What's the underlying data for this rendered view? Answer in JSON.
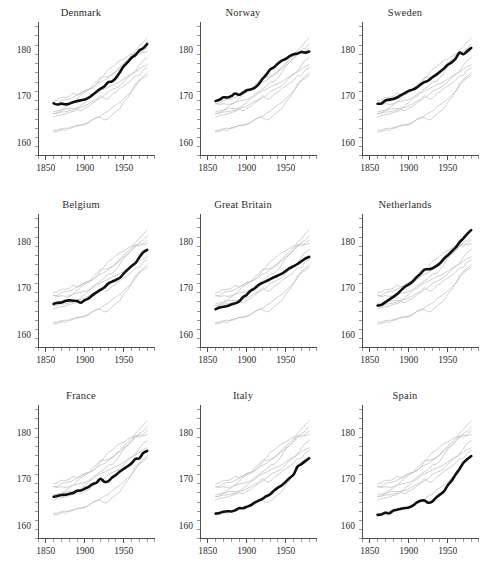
{
  "figure": {
    "type": "small-multiples",
    "panel_rows": 3,
    "panel_cols": 3,
    "background": "#ffffff",
    "focus_color": "#101010",
    "background_series_color": "#bdbdbd"
  },
  "axes": {
    "x_label": "",
    "y_label": "",
    "x_ticks": [
      1850,
      1900,
      1950
    ],
    "x_tick_labels": [
      "1850",
      "1900",
      "1950"
    ],
    "x_minor_step": 10,
    "x_range": [
      1840,
      1990
    ],
    "y_ticks": [
      160,
      170,
      180
    ],
    "y_tick_labels": [
      "160",
      "170",
      "180"
    ],
    "y_minor_step": 2,
    "y_range": [
      157,
      186
    ],
    "grid": false,
    "legend": "none"
  },
  "chart_data": {
    "type": "line",
    "title": "",
    "subtitle": "",
    "xlabel": "",
    "ylabel": "",
    "xlim": [
      1840,
      1990
    ],
    "ylim": [
      157,
      186
    ],
    "grid": false,
    "legend_position": "none",
    "panel_titles": [
      "Denmark",
      "Norway",
      "Sweden",
      "Belgium",
      "Great Britain",
      "Netherlands",
      "France",
      "Italy",
      "Spain"
    ],
    "x": [
      1860,
      1865,
      1870,
      1875,
      1880,
      1885,
      1890,
      1895,
      1900,
      1905,
      1910,
      1915,
      1920,
      1925,
      1930,
      1935,
      1940,
      1945,
      1950,
      1955,
      1960,
      1965,
      1970,
      1975,
      1980
    ],
    "series": [
      {
        "name": "Denmark",
        "values": [
          168.3,
          168.2,
          168.2,
          168.3,
          168.4,
          168.6,
          168.9,
          169.2,
          169.3,
          169.6,
          170.2,
          170.8,
          171.5,
          172.2,
          172.9,
          173.2,
          174.0,
          175.3,
          176.4,
          177.3,
          178.2,
          179.0,
          179.7,
          180.5,
          181.2
        ]
      },
      {
        "name": "Norway",
        "values": [
          168.8,
          169.1,
          169.6,
          169.7,
          169.8,
          170.4,
          170.3,
          170.7,
          171.1,
          171.3,
          171.9,
          172.6,
          173.6,
          174.6,
          175.6,
          176.2,
          176.9,
          177.5,
          178.0,
          178.5,
          178.9,
          179.3,
          179.4,
          179.5,
          179.6
        ]
      },
      {
        "name": "Sweden",
        "values": [
          168.2,
          168.3,
          168.9,
          169.2,
          169.5,
          169.8,
          170.2,
          170.6,
          171.0,
          171.4,
          171.9,
          172.4,
          172.9,
          173.4,
          173.9,
          174.5,
          175.2,
          175.9,
          176.6,
          177.4,
          178.2,
          179.3,
          179.0,
          179.7,
          180.3
        ]
      },
      {
        "name": "Belgium",
        "values": [
          166.6,
          166.7,
          166.9,
          167.1,
          167.3,
          167.2,
          167.0,
          166.9,
          167.4,
          167.8,
          168.3,
          168.9,
          169.6,
          170.2,
          170.9,
          171.4,
          171.9,
          172.3,
          173.2,
          173.9,
          174.6,
          175.5,
          176.5,
          177.6,
          178.3
        ]
      },
      {
        "name": "Great Britain",
        "values": [
          165.5,
          165.6,
          166.0,
          166.2,
          166.5,
          166.6,
          167.2,
          167.9,
          168.6,
          169.3,
          170.0,
          170.6,
          171.1,
          171.6,
          172.0,
          172.4,
          172.8,
          173.2,
          173.7,
          174.2,
          174.7,
          175.3,
          175.8,
          176.4,
          176.6
        ]
      },
      {
        "name": "Netherlands",
        "values": [
          166.2,
          166.5,
          167.0,
          167.5,
          168.1,
          168.7,
          169.4,
          170.1,
          170.8,
          171.5,
          172.3,
          173.2,
          173.9,
          174.0,
          174.1,
          174.7,
          175.5,
          176.3,
          177.1,
          178.0,
          178.9,
          179.8,
          180.7,
          181.8,
          182.6
        ]
      },
      {
        "name": "France",
        "values": [
          166.2,
          166.3,
          166.4,
          166.6,
          166.8,
          167.0,
          167.3,
          167.6,
          168.0,
          168.4,
          168.9,
          169.3,
          169.9,
          169.3,
          169.6,
          170.3,
          170.9,
          171.5,
          172.1,
          172.9,
          173.4,
          174.3,
          174.6,
          175.6,
          176.0
        ]
      },
      {
        "name": "Italy",
        "values": [
          162.5,
          162.7,
          162.8,
          162.9,
          163.1,
          163.3,
          163.6,
          163.6,
          163.9,
          164.3,
          164.7,
          165.2,
          165.7,
          166.3,
          166.8,
          167.4,
          168.0,
          168.6,
          169.4,
          170.2,
          171.0,
          172.6,
          173.2,
          174.0,
          174.4
        ]
      },
      {
        "name": "Spain",
        "values": [
          162.1,
          162.3,
          162.8,
          162.7,
          163.1,
          163.3,
          163.5,
          163.6,
          163.9,
          164.3,
          164.9,
          165.4,
          165.2,
          164.9,
          165.2,
          165.9,
          166.6,
          167.4,
          168.6,
          169.7,
          171.0,
          172.2,
          173.4,
          174.4,
          175.1
        ]
      }
    ],
    "units": "centimetres",
    "measure": "mean adult male height by birth cohort"
  }
}
